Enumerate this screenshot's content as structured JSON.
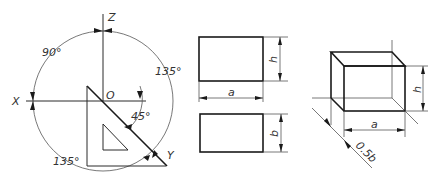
{
  "figure": {
    "axes_diagram": {
      "axis_labels": {
        "z": "Z",
        "x": "X",
        "y": "Y",
        "origin": "O"
      },
      "angles": {
        "top_left": "90°",
        "right": "135°",
        "bottom_left": "135°",
        "triangle": "45°"
      }
    },
    "orthographic_views": {
      "front_view": {
        "width_label": "a",
        "height_label": "h"
      },
      "top_view": {
        "depth_label": "b"
      }
    },
    "isometric_box": {
      "width_label": "a",
      "height_label": "h",
      "depth_label": "0.5b"
    }
  }
}
